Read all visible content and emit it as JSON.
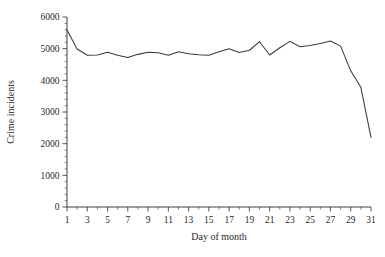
{
  "chart_data": {
    "type": "line",
    "title": "",
    "subtitle": "",
    "xlabel": "Day of month",
    "ylabel": "Crime incidents",
    "x": [
      1,
      2,
      3,
      4,
      5,
      6,
      7,
      8,
      9,
      10,
      11,
      12,
      13,
      14,
      15,
      16,
      17,
      18,
      19,
      20,
      21,
      22,
      23,
      24,
      25,
      26,
      27,
      28,
      29,
      30,
      31
    ],
    "values": [
      5590,
      4990,
      4790,
      4800,
      4890,
      4790,
      4720,
      4820,
      4890,
      4870,
      4790,
      4900,
      4840,
      4810,
      4790,
      4900,
      5000,
      4880,
      4950,
      5220,
      4800,
      5030,
      5230,
      5060,
      5100,
      5160,
      5240,
      5080,
      4300,
      3780,
      2200
    ],
    "series": [
      {
        "name": "Crime incidents",
        "values": [
          5590,
          4990,
          4790,
          4800,
          4890,
          4790,
          4720,
          4820,
          4890,
          4870,
          4790,
          4900,
          4840,
          4810,
          4790,
          4900,
          5000,
          4880,
          4950,
          5220,
          4800,
          5030,
          5230,
          5060,
          5100,
          5160,
          5240,
          5080,
          4300,
          3780,
          2200
        ],
        "color": "#3a3a3a"
      }
    ],
    "xlim": [
      1,
      31
    ],
    "ylim": [
      0,
      6000
    ],
    "yticks": [
      0,
      1000,
      2000,
      3000,
      4000,
      5000,
      6000
    ],
    "ytick_labels": [
      "0",
      "1000",
      "2000",
      "3000",
      "4000",
      "5000",
      "6000"
    ],
    "yminor_step": 200,
    "xticks": [
      1,
      3,
      5,
      7,
      9,
      11,
      13,
      15,
      17,
      19,
      21,
      23,
      25,
      27,
      29,
      31
    ],
    "xtick_labels": [
      "1",
      "3",
      "5",
      "7",
      "9",
      "11",
      "13",
      "15",
      "17",
      "19",
      "21",
      "23",
      "25",
      "27",
      "29",
      "31"
    ],
    "xminor_step": 1,
    "grid": false,
    "legend": false,
    "legend_position": "none"
  }
}
